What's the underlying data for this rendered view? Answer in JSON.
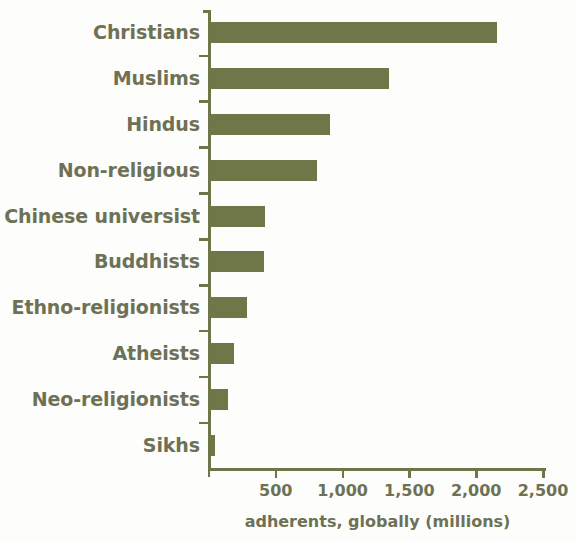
{
  "chart_data": {
    "type": "bar",
    "orientation": "horizontal",
    "title": "",
    "xlabel": "adherents, globally (millions)",
    "ylabel": "",
    "categories": [
      "Christians",
      "Muslims",
      "Hindus",
      "Non-religious",
      "Chinese universist",
      "Buddhists",
      "Ethno-religionists",
      "Atheists",
      "Neo-religionists",
      "Sikhs"
    ],
    "values": [
      2150,
      1340,
      900,
      800,
      410,
      405,
      275,
      180,
      135,
      35
    ],
    "xlim": [
      0,
      2540
    ],
    "xticks": [
      500,
      1000,
      1500,
      2000,
      2500
    ],
    "xtick_labels": [
      "500",
      "1,000",
      "1,500",
      "2,000",
      "2,500"
    ],
    "grid": false,
    "legend": false,
    "bar_color": "#6f7647",
    "text_color": "#6d7155",
    "axis_color": "#6f7548",
    "background_color": "#fdfdfb"
  }
}
